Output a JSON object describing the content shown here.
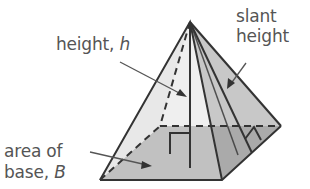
{
  "labels": {
    "height": {
      "text": "height, ",
      "var": "h"
    },
    "slant_height": {
      "line1": "slant",
      "line2": "height"
    },
    "base_area": {
      "line1": "area of",
      "line2": "base, ",
      "var": "B"
    }
  },
  "colors": {
    "face_light": "#e8e8e8",
    "face_mid": "#d4d4d4",
    "face_right": "#b8b8b8",
    "base": "#9a9a9a",
    "edge": "#333333",
    "text": "#555555"
  }
}
